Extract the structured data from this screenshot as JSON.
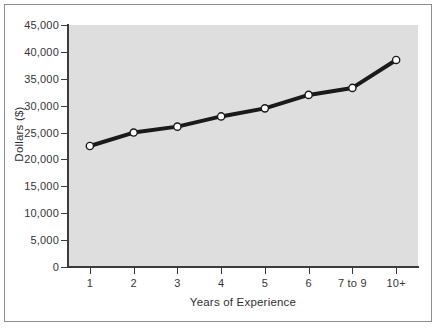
{
  "chart_data": {
    "type": "line",
    "title": "",
    "xlabel": "Years of Experience",
    "ylabel": "Dollars ($)",
    "categories": [
      "1",
      "2",
      "3",
      "4",
      "5",
      "6",
      "7 to 9",
      "10+"
    ],
    "values": [
      22500,
      25000,
      26100,
      28000,
      29500,
      32000,
      33300,
      38500
    ],
    "ylim": [
      0,
      45000
    ],
    "y_ticks": [
      0,
      5000,
      10000,
      15000,
      20000,
      25000,
      30000,
      35000,
      40000,
      45000
    ],
    "y_tick_labels": [
      "0",
      "5,000",
      "10,000",
      "15,000",
      "20,000",
      "25,000",
      "30,000",
      "35,000",
      "40,000",
      "45,000"
    ],
    "grid": false,
    "legend": "none",
    "series": [
      {
        "name": "Salary",
        "values": [
          22500,
          25000,
          26100,
          28000,
          29500,
          32000,
          33300,
          38500
        ]
      }
    ],
    "style": {
      "line_color": "#1a1a1a",
      "marker_fill": "#ffffff",
      "marker_edge": "#1a1a1a",
      "plot_background": "#dedede",
      "figure_background": "#ffffff",
      "axis_color": "#3b3b3b",
      "text_color": "#35353a",
      "frame_color": "#8d8d8d"
    }
  }
}
